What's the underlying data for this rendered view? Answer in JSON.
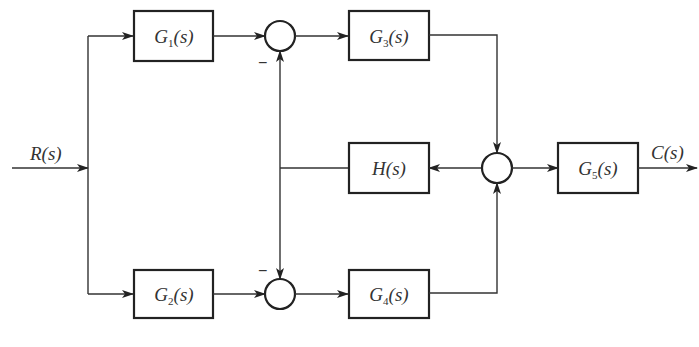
{
  "diagram": {
    "type": "control-system-block-diagram",
    "input": {
      "label": "R(s)",
      "name": "R",
      "arg": "(s)"
    },
    "output": {
      "label": "C(s)",
      "name": "C",
      "arg": "(s)"
    },
    "blocks": [
      {
        "id": "G1",
        "label": "G1(s)",
        "name": "G",
        "sub": "1",
        "arg": "(s)"
      },
      {
        "id": "G2",
        "label": "G2(s)",
        "name": "G",
        "sub": "2",
        "arg": "(s)"
      },
      {
        "id": "G3",
        "label": "G3(s)",
        "name": "G",
        "sub": "3",
        "arg": "(s)"
      },
      {
        "id": "G4",
        "label": "G4(s)",
        "name": "G",
        "sub": "4",
        "arg": "(s)"
      },
      {
        "id": "H",
        "label": "H(s)",
        "name": "H",
        "sub": "",
        "arg": "(s)"
      },
      {
        "id": "G5",
        "label": "G5(s)",
        "name": "G",
        "sub": "5",
        "arg": "(s)"
      }
    ],
    "summing_junctions": [
      {
        "id": "S1",
        "inputs": [
          "G1 (+)",
          "H (-)"
        ],
        "output": "G3",
        "minus_sign": "−"
      },
      {
        "id": "S2",
        "inputs": [
          "G2 (+)",
          "H (-)"
        ],
        "output": "G4",
        "minus_sign": "−"
      },
      {
        "id": "S3",
        "inputs": [
          "G3 (+)",
          "G4 (+)"
        ],
        "output": "G5 and H"
      }
    ],
    "connections": [
      "R(s) -> G1",
      "R(s) -> G2",
      "G1 -> S1",
      "G2 -> S2",
      "S1 -> G3",
      "S2 -> G4",
      "G3 -> S3",
      "G4 -> S3",
      "S3 -> G5",
      "S3 -> H",
      "H -> S1 (-)",
      "H -> S2 (-)",
      "G5 -> C(s)"
    ]
  }
}
